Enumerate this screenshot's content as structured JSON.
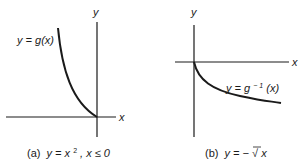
{
  "panels": [
    {
      "id": "a",
      "axis_x_label": "x",
      "axis_y_label": "y",
      "curve_label": "y = g(x)",
      "caption_prefix": "(a)",
      "caption": "y = x², x ≤ 0",
      "caption_parts": {
        "lhs": "y = x",
        "exp": "2",
        "rest": ", x ≤ 0"
      }
    },
    {
      "id": "b",
      "axis_x_label": "x",
      "axis_y_label": "y",
      "curve_label": "y = g⁻¹(x)",
      "curve_label_parts": {
        "lhs": "y = g",
        "exp": "− 1",
        "rest": "(x)"
      },
      "caption_prefix": "(b)",
      "caption": "y = −√x",
      "caption_parts": {
        "lhs": "y = − ",
        "radical": "√",
        "arg": "x"
      }
    }
  ],
  "colors": {
    "ink": "#1a1a1a",
    "background": "#ffffff"
  }
}
